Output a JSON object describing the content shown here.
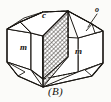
{
  "figure": {
    "caption": "(B)",
    "kind": "crystal-form-diagram",
    "line_color": "#1a1713",
    "hatch_color": "#2a2621",
    "background_color": "#fbfbf9",
    "fill_color": "#ffffff"
  },
  "labels": {
    "c": "c",
    "o": "o",
    "m_left": "m",
    "m_right": "m"
  },
  "geometry": {
    "top_apex": [
      68,
      10
    ],
    "left_upper": [
      6,
      28
    ],
    "right_upper": [
      104,
      30
    ],
    "bottom_apex": [
      43,
      87
    ],
    "prism_top_front_left": [
      32,
      32
    ],
    "prism_top_front_right": [
      78,
      38
    ]
  }
}
